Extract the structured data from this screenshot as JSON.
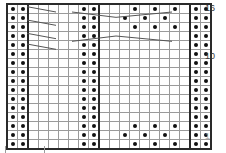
{
  "chart": {
    "type": "knitting-chart",
    "columns": 20,
    "rows": 16,
    "cell_width_px": 9,
    "cell_height_px": 8,
    "symbols": {
      "filled": "purl-dot",
      "empty": "knit-blank",
      "diagonal": "cable-cross-line"
    },
    "colors": {
      "grid_line": "#9a9a9a",
      "border_line": "#2a2a2a",
      "dot": "#111111",
      "background": "#ffffff",
      "label": "#3a3a3a"
    },
    "row_labels": [
      {
        "row": 16,
        "text": "16"
      },
      {
        "row": 10,
        "text": "10"
      },
      {
        "row": 1,
        "text": "1"
      }
    ],
    "grid": [
      [
        1,
        1,
        0,
        0,
        0,
        0,
        0,
        1,
        1,
        0,
        0,
        0,
        1,
        0,
        1,
        0,
        1,
        0,
        1,
        1
      ],
      [
        1,
        1,
        0,
        0,
        0,
        0,
        0,
        1,
        1,
        0,
        0,
        1,
        0,
        1,
        0,
        1,
        0,
        0,
        1,
        1
      ],
      [
        1,
        1,
        0,
        0,
        0,
        0,
        0,
        1,
        1,
        0,
        0,
        0,
        1,
        0,
        1,
        0,
        1,
        0,
        1,
        1
      ],
      [
        1,
        1,
        0,
        0,
        0,
        0,
        0,
        1,
        1,
        0,
        0,
        0,
        0,
        0,
        0,
        0,
        0,
        0,
        1,
        1
      ],
      [
        1,
        1,
        0,
        0,
        0,
        0,
        0,
        1,
        1,
        0,
        0,
        0,
        0,
        0,
        0,
        0,
        0,
        0,
        1,
        1
      ],
      [
        1,
        1,
        0,
        0,
        0,
        0,
        0,
        1,
        1,
        0,
        0,
        0,
        0,
        0,
        0,
        0,
        0,
        0,
        1,
        1
      ],
      [
        1,
        1,
        0,
        0,
        0,
        0,
        0,
        1,
        1,
        0,
        0,
        0,
        0,
        0,
        0,
        0,
        0,
        0,
        1,
        1
      ],
      [
        1,
        1,
        0,
        0,
        0,
        0,
        0,
        1,
        1,
        0,
        0,
        0,
        0,
        0,
        0,
        0,
        0,
        0,
        1,
        1
      ],
      [
        1,
        1,
        0,
        0,
        0,
        0,
        0,
        1,
        1,
        0,
        0,
        0,
        0,
        0,
        0,
        0,
        0,
        0,
        1,
        1
      ],
      [
        1,
        1,
        0,
        0,
        0,
        0,
        0,
        1,
        1,
        0,
        0,
        0,
        0,
        0,
        0,
        0,
        0,
        0,
        1,
        1
      ],
      [
        1,
        1,
        0,
        0,
        0,
        0,
        0,
        1,
        1,
        0,
        0,
        0,
        0,
        0,
        0,
        0,
        0,
        0,
        1,
        1
      ],
      [
        1,
        1,
        0,
        0,
        0,
        0,
        0,
        1,
        1,
        0,
        0,
        0,
        0,
        0,
        0,
        0,
        0,
        0,
        1,
        1
      ],
      [
        1,
        1,
        0,
        0,
        0,
        0,
        0,
        1,
        1,
        0,
        0,
        0,
        0,
        0,
        0,
        0,
        0,
        0,
        1,
        1
      ],
      [
        1,
        1,
        0,
        0,
        0,
        0,
        0,
        1,
        1,
        0,
        0,
        0,
        1,
        0,
        1,
        0,
        1,
        0,
        1,
        1
      ],
      [
        1,
        1,
        0,
        0,
        0,
        0,
        0,
        1,
        1,
        0,
        0,
        1,
        0,
        1,
        0,
        1,
        0,
        0,
        1,
        1
      ],
      [
        1,
        1,
        0,
        0,
        0,
        0,
        0,
        1,
        1,
        0,
        0,
        0,
        1,
        0,
        1,
        0,
        1,
        0,
        1,
        1
      ]
    ],
    "diagonals": [
      {
        "name": "left-cable-1",
        "x1": 63,
        "y1": 11,
        "x2": 150,
        "y2": 27
      },
      {
        "name": "left-cable-2",
        "x1": 63,
        "y1": 51,
        "x2": 150,
        "y2": 67
      },
      {
        "name": "left-cable-3",
        "x1": 63,
        "y1": 91,
        "x2": 150,
        "y2": 107
      },
      {
        "name": "left-cable-4",
        "x1": 63,
        "y1": 123,
        "x2": 150,
        "y2": 139
      },
      {
        "name": "upper-vee-left",
        "x1": 198,
        "y1": 27,
        "x2": 330,
        "y2": 43
      },
      {
        "name": "upper-vee-right",
        "x1": 330,
        "y1": 43,
        "x2": 498,
        "y2": 27
      },
      {
        "name": "lower-peak-left",
        "x1": 198,
        "y1": 115,
        "x2": 330,
        "y2": 99
      },
      {
        "name": "lower-peak-right",
        "x1": 330,
        "y1": 99,
        "x2": 498,
        "y2": 115
      }
    ]
  }
}
